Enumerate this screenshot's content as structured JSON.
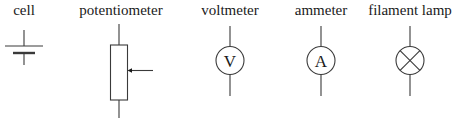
{
  "symbols": [
    {
      "id": "cell",
      "label": "cell"
    },
    {
      "id": "potentiometer",
      "label": "potentiometer"
    },
    {
      "id": "voltmeter",
      "label": "voltmeter",
      "letter": "V"
    },
    {
      "id": "ammeter",
      "label": "ammeter",
      "letter": "A"
    },
    {
      "id": "filament-lamp",
      "label": "filament lamp"
    }
  ],
  "colors": {
    "stroke": "#3a3a3a",
    "text": "#1a1a1a",
    "background": "#ffffff"
  }
}
